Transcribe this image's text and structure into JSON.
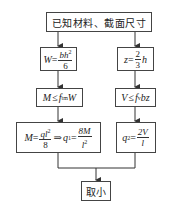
{
  "diagram": {
    "type": "flowchart",
    "start": {
      "label": "已知材料、截面尺寸"
    },
    "left_branch": {
      "section_modulus": {
        "lhs": "W",
        "eq": "=",
        "num": "bh",
        "num_exp": "2",
        "den": "6"
      },
      "moment_condition": {
        "lhs": "M",
        "op": "≤",
        "f": "f",
        "f_sub": "tm",
        "rhs": "W"
      },
      "load_result": {
        "lhs": "M",
        "eq": "=",
        "num": "ql",
        "num_exp": "2",
        "den": "8",
        "implies": "⇒",
        "q": "q",
        "q_sub": "1",
        "eq2": "=",
        "num2": "8M",
        "den2": "l",
        "den2_exp": "2"
      }
    },
    "right_branch": {
      "lever_arm": {
        "lhs": "z",
        "eq": "=",
        "num": "2",
        "den": "3",
        "rhs": "h"
      },
      "shear_condition": {
        "lhs": "V",
        "op": "≤",
        "f": "f",
        "f_sub": "v",
        "rhs": "bz"
      },
      "load_result": {
        "q": "q",
        "q_sub": "2",
        "eq": "=",
        "num": "2V",
        "den": "l"
      }
    },
    "end": {
      "label": "取小"
    },
    "colors": {
      "line": "#333333",
      "box_border": "#444444",
      "background": "#ffffff"
    }
  }
}
